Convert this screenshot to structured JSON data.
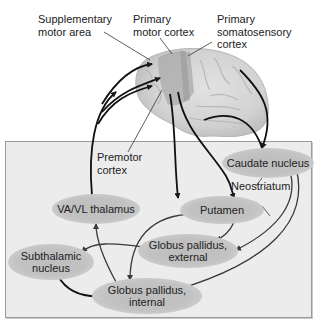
{
  "diagram": {
    "cortical_labels": {
      "supplementary_motor_area": [
        "Supplementary",
        "motor area"
      ],
      "primary_motor_cortex": [
        "Primary",
        "motor cortex"
      ],
      "primary_somatosensory_cortex": [
        "Primary",
        "somatosensory",
        "cortex"
      ],
      "premotor_cortex": [
        "Premotor",
        "cortex"
      ]
    },
    "nodes": {
      "caudate_nucleus": [
        "Caudate nucleus"
      ],
      "neostriatum": [
        "Neostriatum"
      ],
      "va_vl_thalamus": [
        "VA/VL thalamus"
      ],
      "putamen": [
        "Putamen"
      ],
      "globus_pallidus_external": [
        "Globus pallidus,",
        "external"
      ],
      "subthalamic_nucleus": [
        "Subthalamic",
        "nucleus"
      ],
      "globus_pallidus_internal": [
        "Globus pallidus,",
        "internal"
      ]
    },
    "connections": [
      {
        "from": "cortex",
        "to": "caudate_nucleus"
      },
      {
        "from": "cortex",
        "to": "putamen"
      },
      {
        "from": "caudate_nucleus",
        "to": "globus_pallidus_external"
      },
      {
        "from": "caudate_nucleus",
        "to": "globus_pallidus_internal"
      },
      {
        "from": "putamen",
        "to": "globus_pallidus_external"
      },
      {
        "from": "putamen",
        "to": "globus_pallidus_internal"
      },
      {
        "from": "globus_pallidus_external",
        "to": "subthalamic_nucleus"
      },
      {
        "from": "subthalamic_nucleus",
        "to": "globus_pallidus_internal"
      },
      {
        "from": "globus_pallidus_internal",
        "to": "va_vl_thalamus"
      },
      {
        "from": "va_vl_thalamus",
        "to": "cortex"
      }
    ],
    "colors": {
      "panel": "#ececec",
      "node": "#c0c0c0",
      "brain": "#d4d4d4",
      "motor_strip": "#a8a8a8",
      "arrow": "#1a1a1a"
    }
  }
}
